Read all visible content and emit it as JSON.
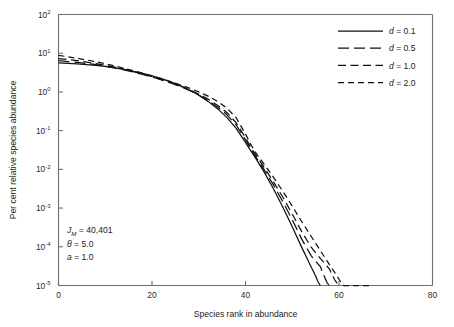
{
  "chart_data": {
    "type": "line",
    "title": "",
    "xlabel": "Species rank in abundance",
    "ylabel": "Per cent relative species abundance",
    "xlim": [
      0,
      80
    ],
    "ylim": [
      1e-05,
      100
    ],
    "yscale": "log",
    "xscale": "linear",
    "xticks": [
      0,
      20,
      40,
      60,
      80
    ],
    "xtick_labels": [
      "0",
      "20",
      "40",
      "60",
      "80"
    ],
    "yticks": [
      100,
      10,
      1,
      0.1,
      0.01,
      0.001,
      0.0001,
      1e-05
    ],
    "ytick_labels": [
      "10",
      "10",
      "10",
      "10",
      "10",
      "10",
      "10",
      "10"
    ],
    "ytick_exponents": [
      "2",
      "1",
      "0",
      "-1",
      "-2",
      "-3",
      "-4",
      "-5"
    ],
    "grid": false,
    "legend_position": "top-right",
    "series": [
      {
        "name": "d = 0.1",
        "dash": "solid",
        "x": [
          0,
          2,
          4,
          6,
          8,
          10,
          12,
          14,
          16,
          18,
          20,
          22,
          24,
          26,
          28,
          30,
          32,
          34,
          36,
          38,
          40,
          41,
          42,
          44,
          46,
          48,
          50,
          52,
          53,
          54,
          55,
          55.5,
          56
        ],
        "y": [
          5.6,
          5.45,
          5.3,
          5.1,
          4.85,
          4.55,
          4.2,
          3.8,
          3.4,
          3.0,
          2.6,
          2.2,
          1.82,
          1.45,
          1.12,
          0.82,
          0.57,
          0.37,
          0.22,
          0.115,
          0.05,
          0.032,
          0.021,
          0.0085,
          0.0031,
          0.00105,
          0.00033,
          9.8e-05,
          5.5e-05,
          3.1e-05,
          1.75e-05,
          1.25e-05,
          1e-05
        ]
      },
      {
        "name": "d = 0.5",
        "dash": "long",
        "x": [
          0,
          2,
          4,
          6,
          8,
          10,
          12,
          14,
          16,
          18,
          20,
          22,
          24,
          26,
          28,
          30,
          32,
          34,
          36,
          38,
          40,
          41,
          42,
          44,
          46,
          48,
          50,
          52,
          54,
          55,
          56,
          57,
          57.5,
          58
        ],
        "y": [
          6.4,
          6.1,
          5.8,
          5.45,
          5.05,
          4.62,
          4.18,
          3.72,
          3.27,
          2.84,
          2.43,
          2.05,
          1.7,
          1.38,
          1.09,
          0.83,
          0.6,
          0.41,
          0.26,
          0.14,
          0.058,
          0.036,
          0.023,
          0.0098,
          0.0039,
          0.00145,
          0.0005,
          0.00016,
          6e-05,
          4.2e-05,
          3.1e-05,
          1.55e-05,
          1.15e-05,
          1e-05
        ]
      },
      {
        "name": "d = 1.0",
        "dash": "medium",
        "x": [
          0,
          2,
          4,
          6,
          8,
          10,
          12,
          14,
          16,
          18,
          20,
          22,
          24,
          26,
          28,
          30,
          32,
          34,
          36,
          38,
          40,
          41,
          42,
          44,
          46,
          48,
          50,
          52,
          54,
          56,
          57,
          58,
          59,
          59.5,
          60
        ],
        "y": [
          7.3,
          6.85,
          6.4,
          5.9,
          5.4,
          4.88,
          4.35,
          3.85,
          3.36,
          2.9,
          2.48,
          2.1,
          1.75,
          1.43,
          1.14,
          0.88,
          0.65,
          0.455,
          0.295,
          0.16,
          0.066,
          0.04,
          0.0255,
          0.0112,
          0.0047,
          0.0019,
          0.0007,
          0.00025,
          0.0001,
          5e-05,
          3.7e-05,
          2.6e-05,
          1.45e-05,
          1.18e-05,
          1e-05
        ]
      },
      {
        "name": "d = 2.0",
        "dash": "short",
        "x": [
          0,
          2,
          4,
          6,
          8,
          10,
          12,
          14,
          16,
          18,
          20,
          22,
          24,
          26,
          28,
          30,
          32,
          34,
          36,
          38,
          40,
          41,
          42,
          44,
          46,
          48,
          50,
          52,
          54,
          56,
          58,
          59,
          60,
          60.5,
          61,
          62,
          63,
          64,
          65,
          66,
          67
        ],
        "y": [
          8.8,
          8.1,
          7.4,
          6.7,
          6.0,
          5.35,
          4.7,
          4.1,
          3.55,
          3.05,
          2.6,
          2.2,
          1.85,
          1.53,
          1.25,
          1.0,
          0.78,
          0.57,
          0.385,
          0.215,
          0.082,
          0.047,
          0.029,
          0.0135,
          0.0062,
          0.0027,
          0.00112,
          0.00045,
          0.00019,
          8e-05,
          3.4e-05,
          2.25e-05,
          1.45e-05,
          1.18e-05,
          1e-05,
          1e-05,
          1e-05,
          1e-05,
          1e-05,
          1e-05,
          1e-05
        ]
      }
    ],
    "annotations": [
      {
        "text_main": "J",
        "text_sub": "M",
        "text_rest": " = 40,401"
      },
      {
        "text_main": "θ",
        "text_sub": "",
        "text_rest": " = 5.0"
      },
      {
        "text_main": "a",
        "text_sub": "",
        "text_rest": " = 1.0"
      }
    ]
  },
  "legend": {
    "entries": [
      {
        "label_sym": "d",
        "label_rest": " = 0.1"
      },
      {
        "label_sym": "d",
        "label_rest": " = 0.5"
      },
      {
        "label_sym": "d",
        "label_rest": " = 1.0"
      },
      {
        "label_sym": "d",
        "label_rest": " = 2.0"
      }
    ]
  },
  "axes": {
    "x_title": "Species rank in abundance",
    "y_title": "Per cent relative species abundance"
  }
}
